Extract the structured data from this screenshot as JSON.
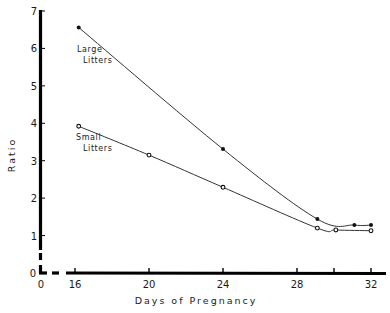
{
  "chart_data": {
    "type": "line",
    "title": "",
    "xlabel": "Days of Pregnancy",
    "ylabel": "Ratio",
    "xlim": [
      0,
      32
    ],
    "ylim": [
      0,
      7
    ],
    "x_axis_break": true,
    "y_axis_break": true,
    "x_ticks": [
      0,
      16,
      20,
      24,
      28,
      30,
      32
    ],
    "x_tick_labels": [
      "0",
      "16",
      "20",
      "24",
      "28",
      "",
      "32"
    ],
    "y_ticks": [
      0,
      1,
      2,
      3,
      4,
      5,
      6,
      7
    ],
    "y_tick_labels": [
      "0",
      "1",
      "2",
      "3",
      "4",
      "5",
      "6",
      "7"
    ],
    "grid": false,
    "legend": "inline annotations",
    "series": [
      {
        "name": "Large Litters",
        "marker": "filled-circle",
        "x": [
          16.2,
          24,
          29.1,
          31.1,
          32
        ],
        "values": [
          6.56,
          3.31,
          1.44,
          1.28,
          1.28
        ]
      },
      {
        "name": "Small Litters",
        "marker": "open-circle",
        "x": [
          16.2,
          20,
          24,
          29.1,
          30.1,
          32
        ],
        "values": [
          3.92,
          3.15,
          2.29,
          1.2,
          1.15,
          1.13
        ]
      }
    ],
    "annotations": [
      {
        "text_line1": "Large",
        "text_line2": "Litters",
        "near_series": "Large Litters"
      },
      {
        "text_line1": "Small",
        "text_line2": "Litters",
        "near_series": "Small Litters"
      }
    ]
  },
  "labels": {
    "xlabel": "Days of Pregnancy",
    "ylabel": "Ratio",
    "large_1": "Large",
    "large_2": "Litters",
    "small_1": "Small",
    "small_2": "Litters"
  }
}
